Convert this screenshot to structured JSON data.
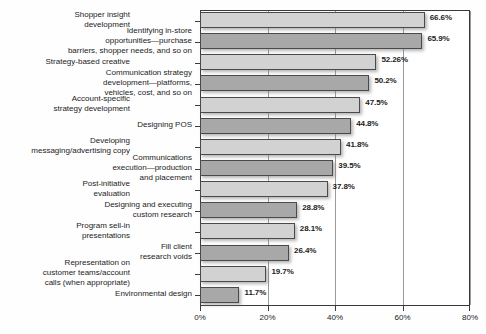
{
  "chart_data": {
    "type": "bar",
    "orientation": "horizontal",
    "title": "",
    "subtitle": "",
    "xlabel": "",
    "ylabel": "",
    "xlim": [
      0,
      80
    ],
    "ylim": null,
    "grid": true,
    "gridlines": [
      20,
      40,
      60,
      80
    ],
    "legend": null,
    "legend_position": "none",
    "xtick_labels": [
      "0%",
      "20%",
      "40%",
      "60%",
      "80%"
    ],
    "xtick_values": [
      0,
      20,
      40,
      60,
      80
    ],
    "categories": [
      "Shopper insight\ndevelopment",
      "Identifying in-store\nopportunities—purchase\nbarriers, shopper needs, and so on",
      "Strategy-based creative",
      "Communication strategy\ndevelopment—platforms,\nvehicles, cost,  and so on",
      "Account-specific\nstrategy development",
      "Designing POS",
      "Developing\nmessaging/advertising copy",
      "Communications\nexecution—production\nand placement",
      "Post-initiative\nevaluation",
      "Designing and executing\ncustom research",
      "Program sell-in\npresentations",
      "Fill client\nresearch voids",
      "Representation on\ncustomer teams/account\ncalls (when appropriate)",
      "Environmental design"
    ],
    "values": [
      66.6,
      65.9,
      52.26,
      50.2,
      47.5,
      44.8,
      41.8,
      39.5,
      37.8,
      28.8,
      28.1,
      26.4,
      19.7,
      11.7
    ],
    "value_labels": [
      "66.6%",
      "65.9%",
      "52.26%",
      "50.2%",
      "47.5%",
      "44.8%",
      "41.8%",
      "39.5%",
      "37.8%",
      "28.8%",
      "28.1%",
      "26.4%",
      "19.7%",
      "11.7%"
    ],
    "bar_shades": [
      "light",
      "dark",
      "light",
      "dark",
      "light",
      "dark",
      "light",
      "dark",
      "light",
      "dark",
      "light",
      "dark",
      "light",
      "dark"
    ],
    "label_columns": [
      "outer",
      "inner",
      "outer",
      "inner",
      "outer",
      "inner",
      "outer",
      "inner",
      "outer",
      "inner",
      "outer",
      "inner",
      "outer",
      "inner"
    ],
    "colors": {
      "bar_light": "#d2d2d2",
      "bar_dark": "#a8a8a8",
      "bar_border": "#4a4a4a",
      "gridline": "#9a9a9a",
      "frame": "#3a3a3a",
      "text": "#1c1c1c",
      "background": "#fefefe"
    }
  }
}
